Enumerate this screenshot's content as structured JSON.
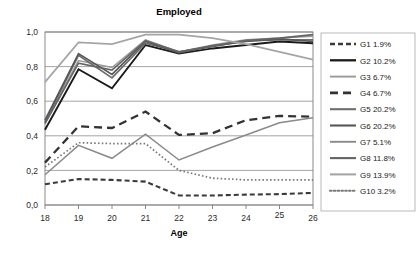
{
  "chart_data": {
    "type": "line",
    "title": "Employed",
    "xlabel": "Age",
    "ylabel": "",
    "x": [
      18,
      19,
      20,
      21,
      22,
      23,
      24,
      25,
      26
    ],
    "xtick_labels": [
      "18",
      "19",
      "20",
      "21",
      "22",
      "23",
      "24",
      "25",
      "26"
    ],
    "ytick_labels": [
      "0,0",
      "0,2",
      "0,4",
      "0,6",
      "0,8",
      "1,0"
    ],
    "ytick_values": [
      0.0,
      0.2,
      0.4,
      0.6,
      0.8,
      1.0
    ],
    "ylim": [
      0.0,
      1.0
    ],
    "xlim": [
      18,
      26
    ],
    "grid": true,
    "legend_position": "right",
    "series": [
      {
        "name": "G1 1.9%",
        "style": "dashed",
        "color": "#3b3b3b",
        "width": 2.1,
        "dash": "5,3",
        "values": [
          0.12,
          0.15,
          0.145,
          0.135,
          0.055,
          0.055,
          0.06,
          0.063,
          0.07
        ]
      },
      {
        "name": "G2 10.2%",
        "style": "solid",
        "color": "#1a1a1a",
        "width": 1.9,
        "dash": "",
        "values": [
          0.435,
          0.785,
          0.675,
          0.925,
          0.875,
          0.905,
          0.925,
          0.945,
          0.935
        ]
      },
      {
        "name": "G3 6.7%",
        "style": "solid",
        "color": "#9a9a9a",
        "width": 1.5,
        "dash": "",
        "values": [
          0.475,
          0.835,
          0.795,
          0.955,
          0.885,
          0.925,
          0.955,
          0.965,
          0.975
        ]
      },
      {
        "name": "G4 6.7%",
        "style": "dashed",
        "color": "#333333",
        "width": 2.3,
        "dash": "8,5",
        "values": [
          0.245,
          0.455,
          0.445,
          0.54,
          0.405,
          0.415,
          0.49,
          0.515,
          0.51
        ]
      },
      {
        "name": "G5 20.2%",
        "style": "solid",
        "color": "#6e6e6e",
        "width": 1.7,
        "dash": "",
        "values": [
          0.48,
          0.865,
          0.735,
          0.935,
          0.885,
          0.915,
          0.95,
          0.955,
          0.955
        ]
      },
      {
        "name": "G6 20.2%",
        "style": "solid",
        "color": "#575757",
        "width": 1.7,
        "dash": "",
        "values": [
          0.49,
          0.875,
          0.755,
          0.945,
          0.88,
          0.92,
          0.945,
          0.96,
          0.945
        ]
      },
      {
        "name": "G7 5.1%",
        "style": "solid",
        "color": "#8a8a8a",
        "width": 1.5,
        "dash": "",
        "values": [
          0.175,
          0.345,
          0.27,
          0.41,
          0.26,
          0.335,
          0.405,
          0.475,
          0.505
        ]
      },
      {
        "name": "G8 11.8%",
        "style": "solid",
        "color": "#646464",
        "width": 1.7,
        "dash": "",
        "values": [
          0.47,
          0.82,
          0.78,
          0.95,
          0.885,
          0.92,
          0.95,
          0.965,
          0.985
        ]
      },
      {
        "name": "G9 13.9%",
        "style": "solid",
        "color": "#a5a5a5",
        "width": 1.7,
        "dash": "",
        "values": [
          0.71,
          0.94,
          0.93,
          0.985,
          0.985,
          0.965,
          0.93,
          0.885,
          0.84
        ]
      },
      {
        "name": "G10 3.2%",
        "style": "dotted",
        "color": "#7a7a7a",
        "width": 1.7,
        "dash": "1.6,2.2",
        "values": [
          0.22,
          0.36,
          0.355,
          0.355,
          0.2,
          0.155,
          0.145,
          0.145,
          0.145
        ]
      }
    ]
  }
}
